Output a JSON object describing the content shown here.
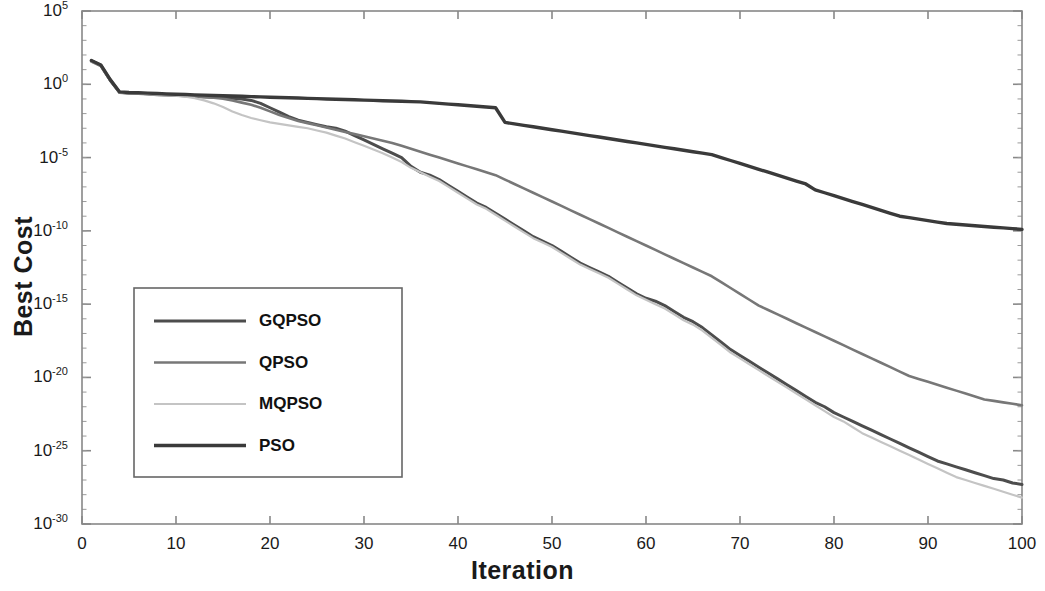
{
  "chart_data": {
    "type": "line",
    "title": "",
    "xlabel": "Iteration",
    "ylabel": "Best Cost",
    "xlim": [
      0,
      100
    ],
    "ylim": [
      1e-30,
      100000.0
    ],
    "yscale": "log",
    "xscale": "linear",
    "grid": false,
    "legend_position": "center-left",
    "xticks": [
      0,
      10,
      20,
      30,
      40,
      50,
      60,
      70,
      80,
      90,
      100
    ],
    "xtick_labels": [
      "0",
      "10",
      "20",
      "30",
      "40",
      "50",
      "60",
      "70",
      "80",
      "90",
      "100"
    ],
    "yticks": [
      100000.0,
      1,
      1e-05,
      1e-10,
      1e-15,
      1e-20,
      1e-25,
      1e-30
    ],
    "ytick_labels": [
      "10^5",
      "10^0",
      "10^-5",
      "10^-10",
      "10^-15",
      "10^-20",
      "10^-25",
      "10^-30"
    ],
    "ytick_mantissas": [
      "10",
      "10",
      "10",
      "10",
      "10",
      "10",
      "10",
      "10"
    ],
    "ytick_exponents": [
      "5",
      "0",
      "-5",
      "-10",
      "-15",
      "-20",
      "-25",
      "-30"
    ],
    "x": [
      1,
      2,
      3,
      4,
      5,
      6,
      7,
      8,
      9,
      10,
      11,
      12,
      13,
      14,
      15,
      16,
      17,
      18,
      19,
      20,
      21,
      22,
      23,
      24,
      25,
      26,
      27,
      28,
      29,
      30,
      31,
      32,
      33,
      34,
      35,
      36,
      37,
      38,
      39,
      40,
      41,
      42,
      43,
      44,
      45,
      46,
      47,
      48,
      49,
      50,
      51,
      52,
      53,
      54,
      55,
      56,
      57,
      58,
      59,
      60,
      61,
      62,
      63,
      64,
      65,
      66,
      67,
      68,
      69,
      70,
      71,
      72,
      73,
      74,
      75,
      76,
      77,
      78,
      79,
      80,
      81,
      82,
      83,
      84,
      85,
      86,
      87,
      88,
      89,
      90,
      91,
      92,
      93,
      94,
      95,
      96,
      97,
      98,
      99,
      100
    ],
    "series": [
      {
        "name": "GQPSO",
        "color": "#4d4d4d",
        "width": 3.0,
        "log10_values": [
          1.6,
          1.3,
          0.3,
          -0.55,
          -0.6,
          -0.62,
          -0.65,
          -0.7,
          -0.72,
          -0.75,
          -0.78,
          -0.82,
          -0.85,
          -0.88,
          -0.9,
          -0.95,
          -1.0,
          -1.1,
          -1.3,
          -1.6,
          -1.9,
          -2.2,
          -2.45,
          -2.6,
          -2.75,
          -2.9,
          -3.0,
          -3.2,
          -3.5,
          -3.8,
          -4.1,
          -4.4,
          -4.7,
          -5.0,
          -5.6,
          -6.0,
          -6.2,
          -6.5,
          -6.9,
          -7.3,
          -7.7,
          -8.1,
          -8.4,
          -8.8,
          -9.2,
          -9.6,
          -10.0,
          -10.4,
          -10.7,
          -11.0,
          -11.4,
          -11.8,
          -12.2,
          -12.5,
          -12.8,
          -13.1,
          -13.5,
          -13.9,
          -14.3,
          -14.6,
          -14.8,
          -15.1,
          -15.5,
          -15.9,
          -16.2,
          -16.6,
          -17.1,
          -17.6,
          -18.1,
          -18.5,
          -18.9,
          -19.3,
          -19.7,
          -20.1,
          -20.5,
          -20.9,
          -21.3,
          -21.7,
          -22.0,
          -22.4,
          -22.7,
          -23.0,
          -23.3,
          -23.6,
          -23.9,
          -24.2,
          -24.5,
          -24.8,
          -25.1,
          -25.4,
          -25.7,
          -25.9,
          -26.1,
          -26.3,
          -26.5,
          -26.7,
          -26.9,
          -27.0,
          -27.2,
          -27.3
        ]
      },
      {
        "name": "QPSO",
        "color": "#777777",
        "width": 2.6,
        "log10_values": [
          1.55,
          1.25,
          0.25,
          -0.58,
          -0.62,
          -0.65,
          -0.68,
          -0.72,
          -0.75,
          -0.78,
          -0.8,
          -0.85,
          -0.88,
          -0.92,
          -0.98,
          -1.1,
          -1.25,
          -1.4,
          -1.6,
          -1.85,
          -2.1,
          -2.3,
          -2.5,
          -2.65,
          -2.8,
          -2.95,
          -3.1,
          -3.25,
          -3.4,
          -3.55,
          -3.7,
          -3.85,
          -4.0,
          -4.2,
          -4.4,
          -4.6,
          -4.8,
          -5.0,
          -5.2,
          -5.4,
          -5.6,
          -5.8,
          -6.0,
          -6.2,
          -6.5,
          -6.8,
          -7.1,
          -7.4,
          -7.7,
          -8.0,
          -8.3,
          -8.6,
          -8.9,
          -9.2,
          -9.5,
          -9.8,
          -10.1,
          -10.4,
          -10.7,
          -11.0,
          -11.3,
          -11.6,
          -11.9,
          -12.2,
          -12.5,
          -12.8,
          -13.1,
          -13.5,
          -13.9,
          -14.3,
          -14.7,
          -15.1,
          -15.4,
          -15.7,
          -16.0,
          -16.3,
          -16.6,
          -16.9,
          -17.2,
          -17.5,
          -17.8,
          -18.1,
          -18.4,
          -18.7,
          -19.0,
          -19.3,
          -19.6,
          -19.9,
          -20.1,
          -20.3,
          -20.5,
          -20.7,
          -20.9,
          -21.1,
          -21.3,
          -21.5,
          -21.6,
          -21.7,
          -21.8,
          -21.9
        ]
      },
      {
        "name": "MQPSO",
        "color": "#c4c4c4",
        "width": 2.2,
        "log10_values": [
          1.58,
          1.28,
          0.28,
          -0.56,
          -0.6,
          -0.63,
          -0.66,
          -0.7,
          -0.74,
          -0.78,
          -0.85,
          -0.95,
          -1.1,
          -1.3,
          -1.55,
          -1.85,
          -2.1,
          -2.3,
          -2.45,
          -2.6,
          -2.7,
          -2.8,
          -2.9,
          -3.0,
          -3.15,
          -3.3,
          -3.5,
          -3.7,
          -3.95,
          -4.2,
          -4.45,
          -4.7,
          -5.0,
          -5.3,
          -5.7,
          -6.0,
          -6.3,
          -6.6,
          -7.0,
          -7.4,
          -7.8,
          -8.2,
          -8.5,
          -8.9,
          -9.3,
          -9.7,
          -10.1,
          -10.5,
          -10.8,
          -11.1,
          -11.5,
          -11.9,
          -12.3,
          -12.6,
          -12.9,
          -13.2,
          -13.6,
          -14.0,
          -14.4,
          -14.7,
          -15.0,
          -15.3,
          -15.7,
          -16.1,
          -16.4,
          -16.8,
          -17.3,
          -17.8,
          -18.3,
          -18.7,
          -19.1,
          -19.5,
          -19.9,
          -20.3,
          -20.7,
          -21.1,
          -21.5,
          -21.9,
          -22.3,
          -22.7,
          -23.0,
          -23.4,
          -23.8,
          -24.1,
          -24.4,
          -24.7,
          -25.0,
          -25.3,
          -25.6,
          -25.9,
          -26.2,
          -26.5,
          -26.8,
          -27.0,
          -27.2,
          -27.4,
          -27.6,
          -27.8,
          -28.0,
          -28.2
        ]
      },
      {
        "name": "PSO",
        "color": "#3a3a3a",
        "width": 3.4,
        "log10_values": [
          1.62,
          1.32,
          0.32,
          -0.52,
          -0.56,
          -0.58,
          -0.6,
          -0.63,
          -0.66,
          -0.68,
          -0.7,
          -0.72,
          -0.74,
          -0.76,
          -0.78,
          -0.8,
          -0.82,
          -0.84,
          -0.86,
          -0.88,
          -0.9,
          -0.92,
          -0.94,
          -0.96,
          -0.98,
          -1.0,
          -1.02,
          -1.04,
          -1.06,
          -1.08,
          -1.1,
          -1.12,
          -1.14,
          -1.16,
          -1.18,
          -1.2,
          -1.25,
          -1.3,
          -1.35,
          -1.4,
          -1.45,
          -1.5,
          -1.55,
          -1.6,
          -2.6,
          -2.7,
          -2.8,
          -2.9,
          -3.0,
          -3.1,
          -3.2,
          -3.3,
          -3.4,
          -3.5,
          -3.6,
          -3.7,
          -3.8,
          -3.9,
          -4.0,
          -4.1,
          -4.2,
          -4.3,
          -4.4,
          -4.5,
          -4.6,
          -4.7,
          -4.8,
          -5.0,
          -5.2,
          -5.4,
          -5.6,
          -5.8,
          -6.0,
          -6.2,
          -6.4,
          -6.6,
          -6.8,
          -7.2,
          -7.4,
          -7.6,
          -7.8,
          -8.0,
          -8.2,
          -8.4,
          -8.6,
          -8.8,
          -9.0,
          -9.1,
          -9.2,
          -9.3,
          -9.4,
          -9.5,
          -9.55,
          -9.6,
          -9.65,
          -9.7,
          -9.75,
          -9.8,
          -9.85,
          -9.9
        ]
      }
    ],
    "legend_entries": [
      {
        "label": "GQPSO",
        "color": "#4d4d4d"
      },
      {
        "label": "QPSO",
        "color": "#777777"
      },
      {
        "label": "MQPSO",
        "color": "#c4c4c4"
      },
      {
        "label": "PSO",
        "color": "#3a3a3a"
      }
    ]
  },
  "axis": {
    "frame_color": "#888888",
    "background": "#ffffff"
  }
}
